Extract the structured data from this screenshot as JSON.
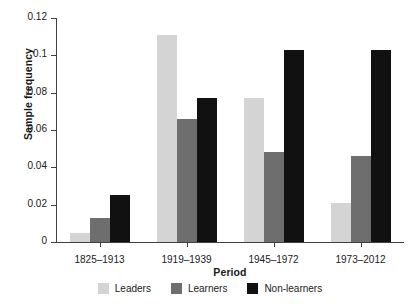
{
  "chart_data": {
    "type": "bar",
    "title": "",
    "subtitle": "",
    "xlabel": "Period",
    "ylabel": "Sample frequency",
    "categories": [
      "1825–1913",
      "1919–1939",
      "1945–1972",
      "1973–2012"
    ],
    "series": [
      {
        "name": "Leaders",
        "color": "#d4d4d4",
        "values": [
          0.005,
          0.111,
          0.077,
          0.021
        ]
      },
      {
        "name": "Learners",
        "color": "#6e6e6e",
        "values": [
          0.013,
          0.066,
          0.048,
          0.046
        ]
      },
      {
        "name": "Non-learners",
        "color": "#111111",
        "values": [
          0.025,
          0.077,
          0.103,
          0.103
        ]
      }
    ],
    "ylim": [
      0,
      0.12
    ],
    "yticks": [
      0,
      0.02,
      0.04,
      0.06,
      0.08,
      0.1,
      0.12
    ],
    "ytick_labels": [
      "0",
      "0.02",
      "0.04",
      "0.06",
      "0.08",
      "0.1",
      "0.12"
    ],
    "grid": false,
    "legend_position": "bottom",
    "grouping": "grouped"
  },
  "legend": {
    "items": [
      {
        "label": "Leaders",
        "color": "#d4d4d4"
      },
      {
        "label": "Learners",
        "color": "#6e6e6e"
      },
      {
        "label": "Non-learners",
        "color": "#111111"
      }
    ]
  },
  "caption": {
    "text": ""
  }
}
